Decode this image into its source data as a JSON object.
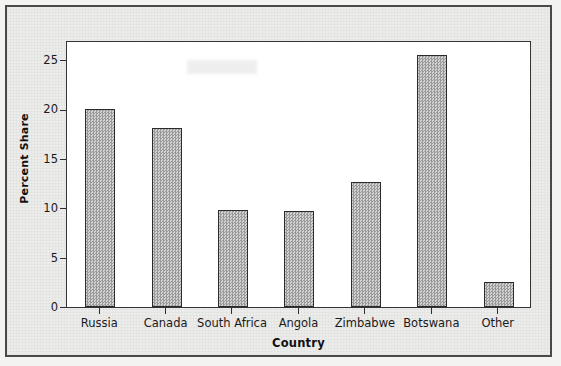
{
  "chart_data": {
    "type": "bar",
    "title": "",
    "xlabel": "Country",
    "ylabel": "Percent Share",
    "categories": [
      "Russia",
      "Canada",
      "South Africa",
      "Angola",
      "Zimbabwe",
      "Botswana",
      "Other"
    ],
    "values": [
      20.0,
      18.1,
      9.8,
      9.7,
      12.6,
      25.5,
      2.5
    ],
    "ylim": [
      0,
      27
    ],
    "yticks": [
      0,
      5,
      10,
      15,
      20,
      25
    ],
    "ytick_labels": [
      "0",
      "5",
      "10",
      "15",
      "20",
      "25"
    ],
    "grid": false,
    "legend": null,
    "bar_color": "#b6b6b6",
    "bar_edge_color": "#2b2b2b",
    "axis_color": "#333333",
    "plot_background": "#ffffff",
    "page_background": "#ececeb"
  }
}
